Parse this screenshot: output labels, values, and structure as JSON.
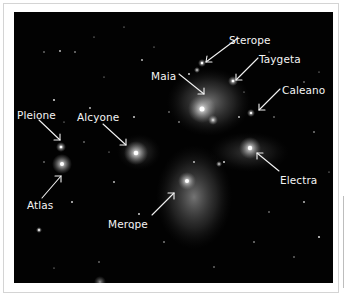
{
  "image": {
    "subject": "Pleiades star cluster (M45) with labeled stars",
    "background_color": "#020202",
    "label_color": "#f4f4f4",
    "labels": [
      {
        "name": "Sterope",
        "x": 215,
        "y": 23
      },
      {
        "name": "Taygeta",
        "x": 245,
        "y": 42
      },
      {
        "name": "Maia",
        "x": 137,
        "y": 61
      },
      {
        "name": "Caleano",
        "x": 268,
        "y": 75
      },
      {
        "name": "Pleione",
        "x": 4,
        "y": 97
      },
      {
        "name": "Alcyone",
        "x": 63,
        "y": 101
      },
      {
        "name": "Electra",
        "x": 266,
        "y": 163
      },
      {
        "name": "Atlas",
        "x": 13,
        "y": 188
      },
      {
        "name": "Merope",
        "x": 94,
        "y": 207
      }
    ]
  }
}
